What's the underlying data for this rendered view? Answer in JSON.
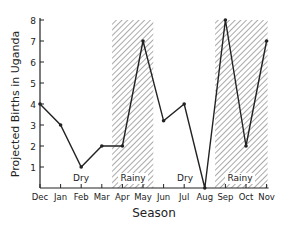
{
  "chart_data": {
    "type": "line",
    "title": "",
    "xlabel": "Season",
    "ylabel": "Projected Births in Uganda",
    "categories": [
      "Dec",
      "Jan",
      "Feb",
      "Mar",
      "Apr",
      "May",
      "Jun",
      "Jul",
      "Aug",
      "Sep",
      "Oct",
      "Nov"
    ],
    "series": [
      {
        "name": "Projected Births",
        "values": [
          4,
          3,
          1,
          2,
          2,
          7,
          3.2,
          4,
          0,
          8,
          2,
          7
        ]
      }
    ],
    "ylim": [
      0,
      8
    ],
    "yticks": [
      1,
      2,
      3,
      4,
      5,
      6,
      7,
      8
    ],
    "grid": false,
    "annotations": [
      {
        "text": "Dry",
        "span": [
          "Dec",
          "Mar"
        ]
      },
      {
        "text": "Rainy",
        "span": [
          "Mar",
          "May"
        ],
        "shaded": true
      },
      {
        "text": "Dry",
        "span": [
          "May",
          "Aug"
        ]
      },
      {
        "text": "Rainy",
        "span": [
          "Aug",
          "Nov"
        ],
        "shaded": true
      }
    ]
  },
  "labels": {
    "xlabel": "Season",
    "ylabel": "Projected Births in Uganda",
    "season1": "Dry",
    "season2": "Rainy",
    "season3": "Dry",
    "season4": "Rainy"
  },
  "colors": {
    "line": "#222222",
    "hatch": "#555555"
  }
}
